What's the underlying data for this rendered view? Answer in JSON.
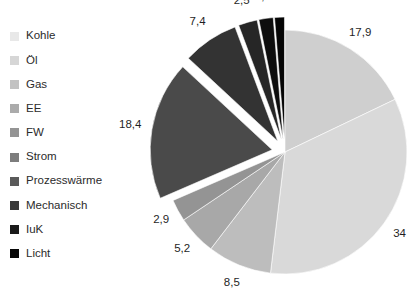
{
  "chart_data": {
    "type": "pie",
    "title": "",
    "legend_position": "left",
    "value_format": "german-decimal-comma",
    "categories": [
      "Kohle",
      "Öl",
      "Gas",
      "EE",
      "FW",
      "Strom",
      "Prozesswärme",
      "Mechanisch",
      "IuK",
      "Licht"
    ],
    "values": [
      17.9,
      34,
      8.5,
      5.2,
      2.9,
      18.4,
      7.4,
      2.5,
      1.9,
      1.3
    ],
    "labels": [
      "17,9",
      "34",
      "8,5",
      "5,2",
      "2,9",
      "18,4",
      "7,4",
      "2,5",
      "1,9",
      "1,3"
    ],
    "colors": [
      "#cfcfcf",
      "#d9d9d9",
      "#bdbdbd",
      "#a8a8a8",
      "#949494",
      "#4a4a4a",
      "#333333",
      "#262626",
      "#0d0d0d",
      "#050505"
    ],
    "exploded": [
      false,
      false,
      false,
      false,
      false,
      true,
      true,
      true,
      true,
      true
    ],
    "start_angle_deg": 0,
    "direction": "clockwise"
  },
  "legend": {
    "items": [
      {
        "label": "Kohle",
        "color": "#e8e8e8"
      },
      {
        "label": "Öl",
        "color": "#d6d6d6"
      },
      {
        "label": "Gas",
        "color": "#c2c2c2"
      },
      {
        "label": "EE",
        "color": "#ababab"
      },
      {
        "label": "FW",
        "color": "#949494"
      },
      {
        "label": "Strom",
        "color": "#7d7d7d"
      },
      {
        "label": "Prozesswärme",
        "color": "#5a5a5a"
      },
      {
        "label": "Mechanisch",
        "color": "#3a3a3a"
      },
      {
        "label": "IuK",
        "color": "#1a1a1a"
      },
      {
        "label": "Licht",
        "color": "#070707"
      }
    ]
  }
}
